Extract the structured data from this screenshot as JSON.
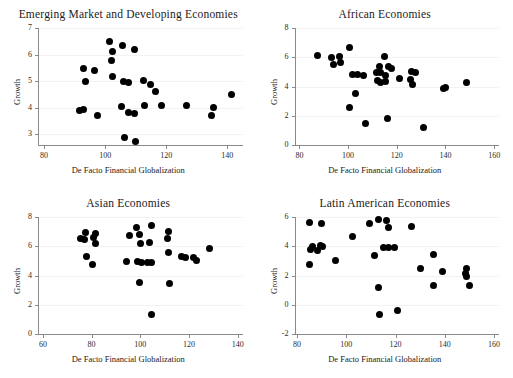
{
  "figure": {
    "panel_count": 4,
    "marker_color": "#000000",
    "axis_color": "#8a8a8a"
  },
  "chart_data": [
    {
      "type": "scatter",
      "title": "Emerging Market and Developing Economies",
      "xlabel": "De Facto Financial Globalization",
      "ylabel": "Growth",
      "xlim": [
        78,
        145
      ],
      "ylim": [
        2.6,
        7.0
      ],
      "xticks": [
        80,
        100,
        120,
        140
      ],
      "yticks": [
        3,
        4,
        5,
        6,
        7
      ],
      "grid": false,
      "points": [
        {
          "x": 101.5,
          "y": 6.5
        },
        {
          "x": 105.8,
          "y": 6.35
        },
        {
          "x": 102.5,
          "y": 6.1
        },
        {
          "x": 109.5,
          "y": 6.2
        },
        {
          "x": 102.0,
          "y": 5.78
        },
        {
          "x": 93.0,
          "y": 5.48
        },
        {
          "x": 96.5,
          "y": 5.42
        },
        {
          "x": 102.5,
          "y": 5.18
        },
        {
          "x": 93.5,
          "y": 4.98
        },
        {
          "x": 106.0,
          "y": 4.98
        },
        {
          "x": 107.5,
          "y": 4.95
        },
        {
          "x": 112.5,
          "y": 5.02
        },
        {
          "x": 115.0,
          "y": 4.88
        },
        {
          "x": 116.5,
          "y": 4.6
        },
        {
          "x": 141.5,
          "y": 4.5
        },
        {
          "x": 113.0,
          "y": 4.1
        },
        {
          "x": 118.5,
          "y": 4.1
        },
        {
          "x": 126.5,
          "y": 4.08
        },
        {
          "x": 135.5,
          "y": 4.02
        },
        {
          "x": 105.5,
          "y": 4.05
        },
        {
          "x": 91.5,
          "y": 3.88
        },
        {
          "x": 93.0,
          "y": 3.92
        },
        {
          "x": 107.5,
          "y": 3.82
        },
        {
          "x": 109.5,
          "y": 3.8
        },
        {
          "x": 135.0,
          "y": 3.72
        },
        {
          "x": 97.5,
          "y": 3.72
        },
        {
          "x": 106.5,
          "y": 2.9
        },
        {
          "x": 110.0,
          "y": 2.72
        }
      ]
    },
    {
      "type": "scatter",
      "title": "African Economies",
      "xlabel": "De Facto Financial Globalization",
      "ylabel": "Growth",
      "xlim": [
        78,
        162
      ],
      "ylim": [
        0,
        8
      ],
      "xticks": [
        80,
        100,
        120,
        140,
        160
      ],
      "yticks": [
        0,
        2,
        4,
        6,
        8
      ],
      "grid": false,
      "points": [
        {
          "x": 87.5,
          "y": 6.15
        },
        {
          "x": 93.0,
          "y": 6.0
        },
        {
          "x": 96.5,
          "y": 6.08
        },
        {
          "x": 100.5,
          "y": 6.65
        },
        {
          "x": 115.0,
          "y": 6.08
        },
        {
          "x": 94.0,
          "y": 5.48
        },
        {
          "x": 97.0,
          "y": 5.62
        },
        {
          "x": 113.0,
          "y": 5.4
        },
        {
          "x": 116.5,
          "y": 5.35
        },
        {
          "x": 118.0,
          "y": 5.2
        },
        {
          "x": 102.0,
          "y": 4.82
        },
        {
          "x": 104.0,
          "y": 4.8
        },
        {
          "x": 106.5,
          "y": 4.78
        },
        {
          "x": 111.5,
          "y": 4.95
        },
        {
          "x": 113.5,
          "y": 4.95
        },
        {
          "x": 115.5,
          "y": 4.75
        },
        {
          "x": 126.0,
          "y": 5.0
        },
        {
          "x": 127.5,
          "y": 4.95
        },
        {
          "x": 112.0,
          "y": 4.4
        },
        {
          "x": 113.5,
          "y": 4.25
        },
        {
          "x": 115.5,
          "y": 4.35
        },
        {
          "x": 121.0,
          "y": 4.55
        },
        {
          "x": 125.5,
          "y": 4.5
        },
        {
          "x": 126.5,
          "y": 4.15
        },
        {
          "x": 139.0,
          "y": 3.88
        },
        {
          "x": 140.0,
          "y": 3.92
        },
        {
          "x": 148.5,
          "y": 4.25
        },
        {
          "x": 103.0,
          "y": 3.5
        },
        {
          "x": 100.5,
          "y": 2.55
        },
        {
          "x": 107.0,
          "y": 1.5
        },
        {
          "x": 116.0,
          "y": 1.78
        },
        {
          "x": 131.0,
          "y": 1.18
        }
      ]
    },
    {
      "type": "scatter",
      "title": "Asian Economies",
      "xlabel": "De Facto Financial Globalization",
      "ylabel": "Growth",
      "xlim": [
        58,
        142
      ],
      "ylim": [
        0,
        8
      ],
      "xticks": [
        60,
        80,
        100,
        120,
        140
      ],
      "yticks": [
        0,
        2,
        4,
        6,
        8
      ],
      "grid": false,
      "points": [
        {
          "x": 98.5,
          "y": 7.25
        },
        {
          "x": 104.5,
          "y": 7.4
        },
        {
          "x": 77.5,
          "y": 6.95
        },
        {
          "x": 81.0,
          "y": 6.6
        },
        {
          "x": 81.5,
          "y": 6.85
        },
        {
          "x": 75.5,
          "y": 6.55
        },
        {
          "x": 77.0,
          "y": 6.45
        },
        {
          "x": 81.5,
          "y": 6.2
        },
        {
          "x": 95.5,
          "y": 6.72
        },
        {
          "x": 99.5,
          "y": 6.82
        },
        {
          "x": 111.5,
          "y": 7.0
        },
        {
          "x": 111.0,
          "y": 6.5
        },
        {
          "x": 100.0,
          "y": 6.18
        },
        {
          "x": 104.0,
          "y": 6.25
        },
        {
          "x": 128.5,
          "y": 5.88
        },
        {
          "x": 111.5,
          "y": 5.55
        },
        {
          "x": 78.0,
          "y": 5.3
        },
        {
          "x": 117.0,
          "y": 5.3
        },
        {
          "x": 118.5,
          "y": 5.25
        },
        {
          "x": 122.0,
          "y": 5.2
        },
        {
          "x": 123.0,
          "y": 5.05
        },
        {
          "x": 94.5,
          "y": 4.98
        },
        {
          "x": 99.0,
          "y": 4.95
        },
        {
          "x": 100.5,
          "y": 4.9
        },
        {
          "x": 103.0,
          "y": 4.9
        },
        {
          "x": 104.5,
          "y": 4.88
        },
        {
          "x": 80.5,
          "y": 4.78
        },
        {
          "x": 99.5,
          "y": 3.55
        },
        {
          "x": 112.0,
          "y": 3.48
        },
        {
          "x": 104.5,
          "y": 1.3
        }
      ]
    },
    {
      "type": "scatter",
      "title": "Latin American Economies",
      "xlabel": "De Facto Financial Globalization",
      "ylabel": "Growth",
      "xlim": [
        79,
        162
      ],
      "ylim": [
        -2,
        6
      ],
      "xticks": [
        80,
        100,
        120,
        140,
        160
      ],
      "yticks": [
        -2,
        0,
        2,
        4,
        6
      ],
      "grid": false,
      "points": [
        {
          "x": 85.0,
          "y": 5.62
        },
        {
          "x": 90.0,
          "y": 5.55
        },
        {
          "x": 109.5,
          "y": 5.55
        },
        {
          "x": 113.0,
          "y": 5.8
        },
        {
          "x": 116.5,
          "y": 5.78
        },
        {
          "x": 117.0,
          "y": 5.25
        },
        {
          "x": 126.5,
          "y": 5.35
        },
        {
          "x": 102.5,
          "y": 4.7
        },
        {
          "x": 86.5,
          "y": 3.95
        },
        {
          "x": 89.5,
          "y": 4.05
        },
        {
          "x": 90.5,
          "y": 3.95
        },
        {
          "x": 85.5,
          "y": 3.78
        },
        {
          "x": 88.5,
          "y": 3.72
        },
        {
          "x": 115.0,
          "y": 3.92
        },
        {
          "x": 117.0,
          "y": 3.92
        },
        {
          "x": 119.5,
          "y": 3.9
        },
        {
          "x": 111.5,
          "y": 3.35
        },
        {
          "x": 135.5,
          "y": 3.45
        },
        {
          "x": 95.5,
          "y": 3.05
        },
        {
          "x": 85.0,
          "y": 2.78
        },
        {
          "x": 130.0,
          "y": 2.48
        },
        {
          "x": 139.0,
          "y": 2.28
        },
        {
          "x": 149.0,
          "y": 2.48
        },
        {
          "x": 148.5,
          "y": 2.12
        },
        {
          "x": 149.0,
          "y": 1.95
        },
        {
          "x": 113.0,
          "y": 1.15
        },
        {
          "x": 135.5,
          "y": 1.32
        },
        {
          "x": 150.0,
          "y": 1.3
        },
        {
          "x": 113.5,
          "y": -0.68
        },
        {
          "x": 121.0,
          "y": -0.4
        }
      ]
    }
  ]
}
